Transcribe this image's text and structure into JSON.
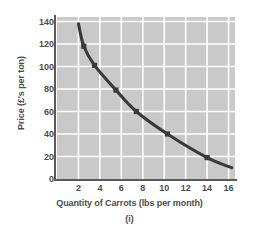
{
  "chart_data": {
    "type": "line",
    "title": "",
    "subtitle": "",
    "caption": "(i)",
    "xlabel": "Quantity of Carrots (lbs per month)",
    "ylabel": "Price (£'s per ton)",
    "xlim": [
      0,
      16.6
    ],
    "ylim": [
      0,
      144
    ],
    "grid": true,
    "legend": null,
    "xticks": [
      "2",
      "4",
      "6",
      "8",
      "10",
      "12",
      "14",
      "16"
    ],
    "xtick_values": [
      2,
      4,
      6,
      8,
      10,
      12,
      14,
      16
    ],
    "yticks": [
      "0",
      "20",
      "40",
      "60",
      "80",
      "100",
      "120",
      "140"
    ],
    "ytick_values": [
      0,
      20,
      40,
      60,
      80,
      100,
      120,
      140
    ],
    "series": [
      {
        "name": "Demand curve",
        "color": "#3a3a3a",
        "marker": "square",
        "x": [
          2.0,
          2.5,
          3.5,
          5.5,
          7.4,
          10.3,
          14.0,
          16.3
        ],
        "y": [
          138,
          118,
          101,
          79,
          60,
          40,
          19,
          10
        ],
        "marker_points": [
          {
            "x": 2.5,
            "y": 118
          },
          {
            "x": 3.5,
            "y": 101
          },
          {
            "x": 5.5,
            "y": 79
          },
          {
            "x": 7.4,
            "y": 60
          },
          {
            "x": 10.3,
            "y": 40
          },
          {
            "x": 14.0,
            "y": 19
          }
        ]
      }
    ],
    "colors": {
      "plot_background": "#c9c9c9",
      "gridline": "#ffffff",
      "curve": "#3a3a3a",
      "axis": "#5a5a5a",
      "text": "#4d4d4d",
      "page_background": "#ffffff"
    }
  }
}
